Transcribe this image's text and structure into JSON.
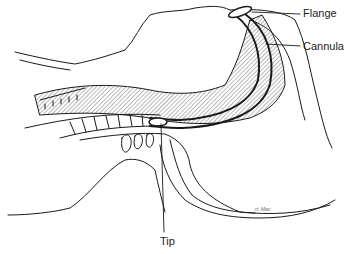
{
  "figure": {
    "labels": {
      "flange": "Flange",
      "cannula": "Cannula",
      "tip": "Tip"
    },
    "signature": "rt. Mac",
    "colors": {
      "line": "#1a1a1a",
      "hatch": "#9a9a9a",
      "background": "#ffffff"
    }
  }
}
